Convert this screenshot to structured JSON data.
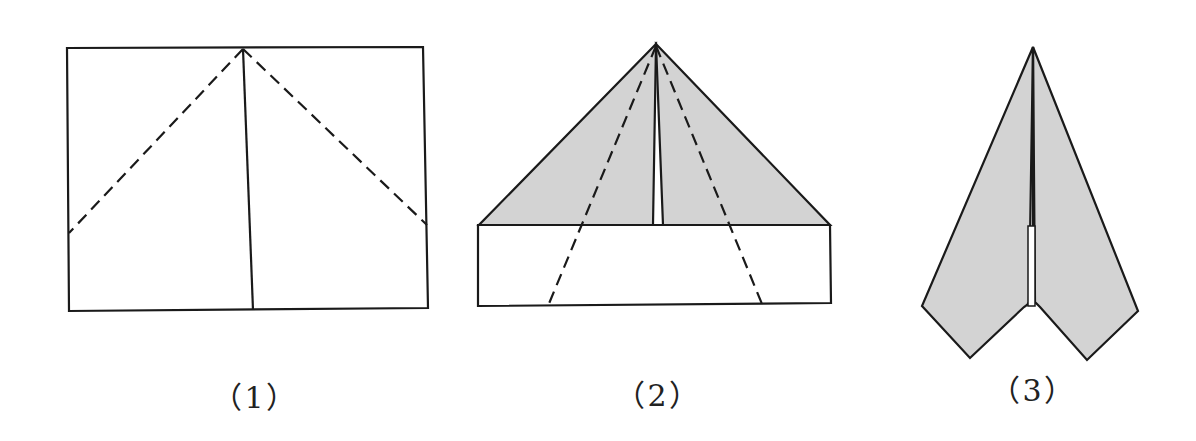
{
  "diagram": {
    "colors": {
      "line": "#1a1a1a",
      "fill": "#d3d3d3",
      "background": "#ffffff"
    },
    "steps": [
      {
        "label": "（1）",
        "description": "Rectangle sheet with center crease; dashed fold lines from top-center to side edges"
      },
      {
        "label": "（2）",
        "description": "Top corners folded to center forming shaded triangle; dashed fold lines from apex to bottom edge"
      },
      {
        "label": "（3）",
        "description": "Sides folded inward to form dart-shaped shaded airplane"
      }
    ]
  }
}
